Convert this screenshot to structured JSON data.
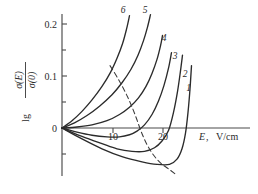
{
  "figure": {
    "background": "#ffffff",
    "ink": "#2b2b2b"
  },
  "axes": {
    "y_label_prefix": "lg",
    "y_label_numerator": "σ(E)",
    "y_label_denominator": "σ(0)",
    "y_ticks_labeled": [
      "0.2",
      "0.1",
      "0"
    ],
    "y_tick_values": [
      0.2,
      0.1,
      0.0
    ],
    "y_minor_tick_values": [
      0.15,
      0.05,
      -0.05
    ],
    "x_ticks_labeled": [
      "10",
      "20"
    ],
    "x_tick_values": [
      10,
      20
    ],
    "x_axis_label_symbol": "E",
    "x_axis_label_comma": ",",
    "x_axis_label_units": "V/cm",
    "x_range": [
      0,
      30
    ],
    "y_range": [
      -0.075,
      0.23
    ],
    "grid": false,
    "legend": "none"
  },
  "curve_labels": [
    {
      "id": "1",
      "text": "1"
    },
    {
      "id": "2",
      "text": "2"
    },
    {
      "id": "3",
      "text": "3"
    },
    {
      "id": "4",
      "text": "4"
    },
    {
      "id": "5",
      "text": "5"
    },
    {
      "id": "6",
      "text": "6"
    }
  ],
  "chart_data": {
    "type": "line",
    "title": "",
    "xlabel": "E, V/cm",
    "ylabel": "lg σ(E)/σ(0)",
    "xlim": [
      0,
      30
    ],
    "ylim": [
      -0.075,
      0.23
    ],
    "grid": false,
    "legend_position": "curve-end-labels",
    "series": [
      {
        "name": "1",
        "label_position": {
          "x": 25.3,
          "y": 0.072
        },
        "points": [
          {
            "x": 0,
            "y": 0
          },
          {
            "x": 4,
            "y": -0.021
          },
          {
            "x": 8,
            "y": -0.04
          },
          {
            "x": 12,
            "y": -0.055
          },
          {
            "x": 16,
            "y": -0.065
          },
          {
            "x": 19,
            "y": -0.07
          },
          {
            "x": 21.5,
            "y": -0.07
          },
          {
            "x": 23,
            "y": -0.06
          },
          {
            "x": 24,
            "y": -0.04
          },
          {
            "x": 24.7,
            "y": -0.01
          },
          {
            "x": 25.2,
            "y": 0.03
          },
          {
            "x": 25.6,
            "y": 0.075
          },
          {
            "x": 25.9,
            "y": 0.12
          }
        ]
      },
      {
        "name": "2",
        "label_position": {
          "x": 24.6,
          "y": 0.098
        },
        "points": [
          {
            "x": 0,
            "y": 0
          },
          {
            "x": 4,
            "y": -0.016
          },
          {
            "x": 8,
            "y": -0.03
          },
          {
            "x": 11,
            "y": -0.04
          },
          {
            "x": 14,
            "y": -0.045
          },
          {
            "x": 16.5,
            "y": -0.045
          },
          {
            "x": 18.5,
            "y": -0.038
          },
          {
            "x": 20,
            "y": -0.025
          },
          {
            "x": 21.3,
            "y": -0.005
          },
          {
            "x": 22.3,
            "y": 0.03
          },
          {
            "x": 23.1,
            "y": 0.07
          },
          {
            "x": 23.7,
            "y": 0.11
          },
          {
            "x": 24.1,
            "y": 0.14
          }
        ]
      },
      {
        "name": "3",
        "label_position": {
          "x": 22.6,
          "y": 0.132
        },
        "points": [
          {
            "x": 0,
            "y": 0
          },
          {
            "x": 3,
            "y": -0.008
          },
          {
            "x": 6,
            "y": -0.014
          },
          {
            "x": 9,
            "y": -0.017
          },
          {
            "x": 11.5,
            "y": -0.017
          },
          {
            "x": 13.5,
            "y": -0.013
          },
          {
            "x": 15,
            "y": -0.006
          },
          {
            "x": 16.5,
            "y": 0.006
          },
          {
            "x": 18,
            "y": 0.026
          },
          {
            "x": 19.3,
            "y": 0.052
          },
          {
            "x": 20.4,
            "y": 0.082
          },
          {
            "x": 21.3,
            "y": 0.115
          },
          {
            "x": 21.9,
            "y": 0.145
          }
        ]
      },
      {
        "name": "4",
        "label_position": {
          "x": 20.4,
          "y": 0.168
        },
        "points": [
          {
            "x": 0,
            "y": 0
          },
          {
            "x": 3,
            "y": 0.002
          },
          {
            "x": 6,
            "y": 0.006
          },
          {
            "x": 9,
            "y": 0.014
          },
          {
            "x": 11.5,
            "y": 0.026
          },
          {
            "x": 13.5,
            "y": 0.04
          },
          {
            "x": 15.3,
            "y": 0.058
          },
          {
            "x": 16.8,
            "y": 0.08
          },
          {
            "x": 18,
            "y": 0.105
          },
          {
            "x": 19,
            "y": 0.132
          },
          {
            "x": 19.7,
            "y": 0.158
          },
          {
            "x": 20.1,
            "y": 0.178
          }
        ]
      },
      {
        "name": "5",
        "label_position": {
          "x": 16.6,
          "y": 0.222
        },
        "points": [
          {
            "x": 0,
            "y": 0
          },
          {
            "x": 2.5,
            "y": 0.01
          },
          {
            "x": 5,
            "y": 0.024
          },
          {
            "x": 7.5,
            "y": 0.042
          },
          {
            "x": 10,
            "y": 0.064
          },
          {
            "x": 12,
            "y": 0.087
          },
          {
            "x": 13.8,
            "y": 0.113
          },
          {
            "x": 15.2,
            "y": 0.14
          },
          {
            "x": 16.3,
            "y": 0.168
          },
          {
            "x": 17.1,
            "y": 0.194
          },
          {
            "x": 17.7,
            "y": 0.218
          }
        ]
      },
      {
        "name": "6",
        "label_position": {
          "x": 12.2,
          "y": 0.222
        },
        "points": [
          {
            "x": 0,
            "y": 0
          },
          {
            "x": 2,
            "y": 0.014
          },
          {
            "x": 4,
            "y": 0.032
          },
          {
            "x": 6,
            "y": 0.054
          },
          {
            "x": 8,
            "y": 0.08
          },
          {
            "x": 9.7,
            "y": 0.107
          },
          {
            "x": 11,
            "y": 0.134
          },
          {
            "x": 12.1,
            "y": 0.162
          },
          {
            "x": 12.9,
            "y": 0.19
          },
          {
            "x": 13.5,
            "y": 0.216
          }
        ]
      }
    ],
    "auxiliary_curves": [
      {
        "name": "minima-locus",
        "style": "dashed",
        "points": [
          {
            "x": 9.6,
            "y": 0.12
          },
          {
            "x": 11.5,
            "y": 0.09
          },
          {
            "x": 13.2,
            "y": 0.058
          },
          {
            "x": 14.6,
            "y": 0.026
          },
          {
            "x": 15.8,
            "y": -0.006
          },
          {
            "x": 17.0,
            "y": -0.032
          },
          {
            "x": 18.3,
            "y": -0.052
          },
          {
            "x": 19.8,
            "y": -0.068
          },
          {
            "x": 21.5,
            "y": -0.08
          },
          {
            "x": 22.6,
            "y": -0.088
          }
        ]
      }
    ]
  }
}
